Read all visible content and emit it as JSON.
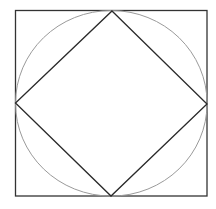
{
  "diagram": {
    "shapes": [
      {
        "id": "outer-square",
        "kind": "square",
        "stroke": "#333333"
      },
      {
        "id": "inscribed-circle",
        "kind": "circle",
        "stroke": "#9a9a9a"
      },
      {
        "id": "inscribed-diamond",
        "kind": "rotated-square",
        "stroke": "#2a2a2a"
      }
    ],
    "background": "#ffffff"
  }
}
